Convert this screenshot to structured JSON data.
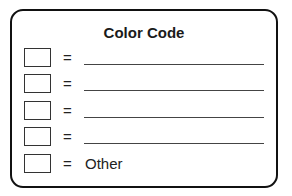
{
  "card": {
    "title": "Color Code",
    "rows": [
      {
        "swatch": "blank-color-box",
        "equals": "=",
        "value": ""
      },
      {
        "swatch": "blank-color-box",
        "equals": "=",
        "value": ""
      },
      {
        "swatch": "blank-color-box",
        "equals": "=",
        "value": ""
      },
      {
        "swatch": "blank-color-box",
        "equals": "=",
        "value": ""
      },
      {
        "swatch": "blank-color-box",
        "equals": "=",
        "value": "Other"
      }
    ]
  },
  "colors": {
    "border": "#111111",
    "background": "#ffffff",
    "text": "#1a1a1a"
  }
}
